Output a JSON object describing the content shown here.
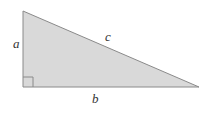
{
  "figure": {
    "kind": "right-triangle-diagram",
    "background_color": "#ffffff",
    "canvas": {
      "width": 210,
      "height": 115
    },
    "triangle": {
      "fill_color": "#d9d9d9",
      "stroke_color": "#8a8a8a",
      "stroke_width": 1,
      "vertices": [
        {
          "name": "top-left-vertex",
          "x": 23,
          "y": 11
        },
        {
          "name": "bottom-left-vertex",
          "x": 23,
          "y": 87
        },
        {
          "name": "bottom-right-vertex",
          "x": 199,
          "y": 87
        }
      ],
      "points_attr": "23,11 23,87 199,87"
    },
    "right_angle_marker": {
      "name": "right-angle-marker",
      "vertex": "bottom-left-vertex",
      "size": 10,
      "stroke_color": "#8a8a8a",
      "path_attr": "M 23 77 L 33 77 L 33 87"
    },
    "labels": [
      {
        "id": "a",
        "text": "a",
        "side": "vertical-leg",
        "x": 15,
        "y": 43
      },
      {
        "id": "b",
        "text": "b",
        "side": "horizontal-leg",
        "x": 96,
        "y": 98
      },
      {
        "id": "c",
        "text": "c",
        "side": "hypotenuse",
        "x": 109,
        "y": 36
      }
    ],
    "label_a_text": "a",
    "label_b_text": "b",
    "label_c_text": "c"
  }
}
